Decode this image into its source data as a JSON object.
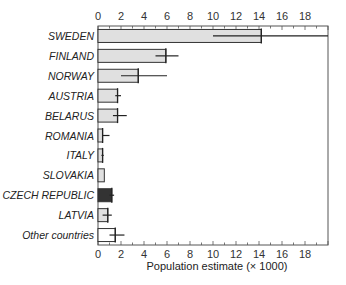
{
  "chart_data": {
    "type": "bar",
    "orientation": "horizontal",
    "title": "",
    "xlabel": "Population estimate (× 1000)",
    "ylabel": "",
    "xlim": [
      0,
      20
    ],
    "xticks": [
      0,
      2,
      4,
      6,
      8,
      10,
      12,
      14,
      16,
      18
    ],
    "grid": false,
    "categories": [
      "SWEDEN",
      "FINLAND",
      "NORWAY",
      "AUSTRIA",
      "BELARUS",
      "ROMANIA",
      "ITALY",
      "SLOVAKIA",
      "CZECH REPUBLIC",
      "LATVIA",
      "Other countries"
    ],
    "values": [
      14.2,
      5.9,
      3.5,
      1.7,
      1.7,
      0.4,
      0.4,
      0.55,
      1.2,
      0.85,
      1.5
    ],
    "error_low": [
      10.0,
      5.0,
      2.0,
      1.5,
      1.3,
      0.4,
      0.3,
      null,
      1.0,
      0.4,
      1.0
    ],
    "error_high": [
      20.0,
      7.0,
      6.0,
      2.0,
      2.5,
      1.0,
      0.5,
      null,
      1.4,
      1.2,
      2.3
    ],
    "bar_colors": [
      "#e0e0e0",
      "#e0e0e0",
      "#e0e0e0",
      "#e0e0e0",
      "#e0e0e0",
      "#e0e0e0",
      "#e0e0e0",
      "#e0e0e0",
      "#333333",
      "#e0e0e0",
      "#ffffff"
    ],
    "highlighted": "CZECH REPUBLIC"
  }
}
